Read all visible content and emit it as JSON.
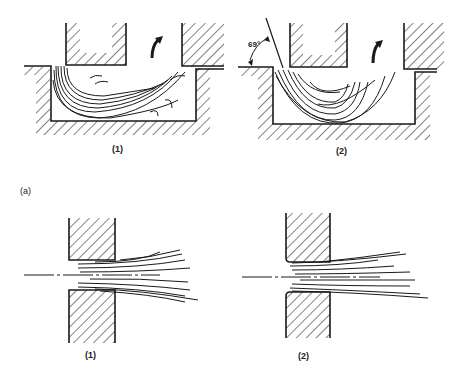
{
  "figure": {
    "part_label": "(a)",
    "top_row": [
      {
        "caption": "(1)",
        "description": "Punch entering die cavity; flow lines curl with turbulence near square die corner"
      },
      {
        "caption": "(2)",
        "description": "Die with 69° entry angle; smooth curved flow lines"
      }
    ],
    "bottom_row": [
      {
        "caption": "(1)",
        "description": "Flow through square-edged die opening"
      },
      {
        "caption": "(2)",
        "description": "Flow through rounded die opening"
      }
    ],
    "angle_label": "69°",
    "colors": {
      "line": "#1a1a1a",
      "background": "#ffffff"
    }
  }
}
